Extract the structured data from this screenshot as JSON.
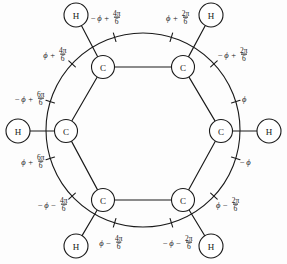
{
  "figure": {
    "name": "benzene-phase-diagram",
    "width": 287,
    "height": 264,
    "background_color": "#fdfdfd",
    "stroke_color": "#1a1a1a"
  },
  "ring": {
    "label": "benzene-ring",
    "carbon_label": "C",
    "hydrogen_label": "H",
    "carbons": [
      {
        "id": "c-top-left",
        "label": "C",
        "cx": 103,
        "cy": 67
      },
      {
        "id": "c-top-right",
        "label": "C",
        "cx": 183,
        "cy": 67
      },
      {
        "id": "c-right",
        "label": "C",
        "cx": 221,
        "cy": 131
      },
      {
        "id": "c-bottom-right",
        "label": "C",
        "cx": 183,
        "cy": 200
      },
      {
        "id": "c-bottom-left",
        "label": "C",
        "cx": 103,
        "cy": 200
      },
      {
        "id": "c-left",
        "label": "C",
        "cx": 66,
        "cy": 131
      }
    ],
    "hydrogens": [
      {
        "id": "h-top-left",
        "label": "H",
        "cx": 76,
        "cy": 15
      },
      {
        "id": "h-top-right",
        "label": "H",
        "cx": 211,
        "cy": 15
      },
      {
        "id": "h-right",
        "label": "H",
        "cx": 269,
        "cy": 131
      },
      {
        "id": "h-bottom-right",
        "label": "H",
        "cx": 211,
        "cy": 246
      },
      {
        "id": "h-bottom-left",
        "label": "H",
        "cx": 76,
        "cy": 246
      },
      {
        "id": "h-left",
        "label": "H",
        "cx": 18,
        "cy": 131
      }
    ]
  },
  "outer_circle": {
    "label": "outer-phase-circle",
    "cx": 143,
    "cy": 130,
    "r": 97
  },
  "phase_labels": [
    {
      "id": "phase-top-left",
      "sign": "−",
      "phi": "ϕ",
      "operator": "+",
      "numerator": "4π",
      "denominator": "6",
      "x": 122,
      "y": 18,
      "align": "right",
      "tick_angle": -107
    },
    {
      "id": "phase-top-right",
      "sign": "",
      "phi": "ϕ",
      "operator": "+",
      "numerator": "2π",
      "denominator": "6",
      "x": 166,
      "y": 18,
      "align": "left",
      "tick_angle": -73
    },
    {
      "id": "phase-upper-left",
      "sign": "",
      "phi": "ϕ",
      "operator": "+",
      "numerator": "4π",
      "denominator": "6",
      "x": 68,
      "y": 55,
      "align": "right",
      "tick_angle": -137
    },
    {
      "id": "phase-upper-right",
      "sign": "−",
      "phi": "ϕ",
      "operator": "+",
      "numerator": "2π",
      "denominator": "6",
      "x": 218,
      "y": 55,
      "align": "left",
      "tick_angle": -43
    },
    {
      "id": "phase-mid-left-upper",
      "sign": "−",
      "phi": "ϕ",
      "operator": "+",
      "numerator": "6π",
      "denominator": "6",
      "x": 46,
      "y": 99,
      "align": "right",
      "tick_angle": -163
    },
    {
      "id": "phase-mid-right-upper",
      "sign": "",
      "phi": "ϕ",
      "operator": "",
      "numerator": "",
      "denominator": "",
      "x": 242,
      "y": 99,
      "align": "left",
      "tick_angle": -17
    },
    {
      "id": "phase-mid-left-lower",
      "sign": "",
      "phi": "ϕ",
      "operator": "+",
      "numerator": "6π",
      "denominator": "6",
      "x": 46,
      "y": 162,
      "align": "right",
      "tick_angle": 163
    },
    {
      "id": "phase-mid-right-lower",
      "sign": "−",
      "phi": "ϕ",
      "operator": "",
      "numerator": "",
      "denominator": "",
      "x": 240,
      "y": 162,
      "align": "left",
      "tick_angle": 17
    },
    {
      "id": "phase-lower-left",
      "sign": "−",
      "phi": "ϕ",
      "operator": "−",
      "numerator": "4π",
      "denominator": "6",
      "x": 69,
      "y": 205,
      "align": "right",
      "tick_angle": 137
    },
    {
      "id": "phase-lower-right",
      "sign": "",
      "phi": "ϕ",
      "operator": "−",
      "numerator": "2π",
      "denominator": "6",
      "x": 216,
      "y": 205,
      "align": "left",
      "tick_angle": 43
    },
    {
      "id": "phase-bottom-left",
      "sign": "",
      "phi": "ϕ",
      "operator": "−",
      "numerator": "4π",
      "denominator": "6",
      "x": 124,
      "y": 243,
      "align": "right",
      "tick_angle": 107
    },
    {
      "id": "phase-bottom-right",
      "sign": "−",
      "phi": "ϕ",
      "operator": "−",
      "numerator": "2π",
      "denominator": "6",
      "x": 163,
      "y": 243,
      "align": "left",
      "tick_angle": 73
    }
  ]
}
